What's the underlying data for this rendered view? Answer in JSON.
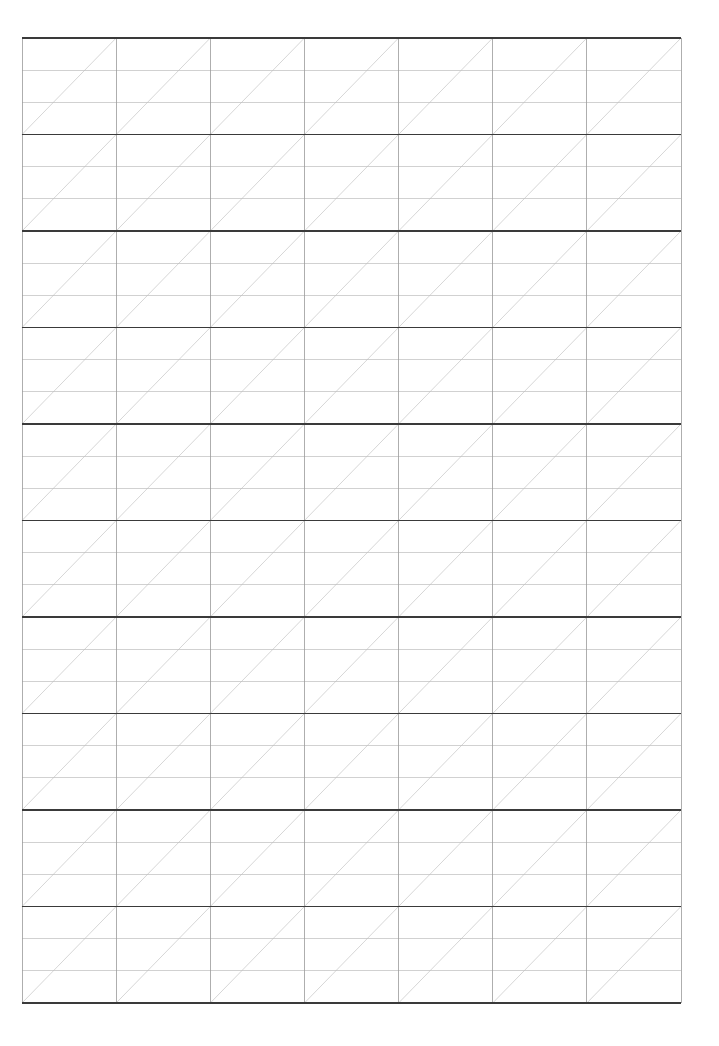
{
  "page": {
    "width": 719,
    "height": 1046,
    "background_color": "#ffffff"
  },
  "grid": {
    "name": "practice-grid",
    "origin_x": 22,
    "origin_y": 38,
    "width": 659,
    "height": 965,
    "columns": 7,
    "rows": 10,
    "cell_width": 94.14,
    "cell_height": 96.5,
    "sub_rows_per_cell": 3,
    "diagonal_direction": "bottom-left-to-top-right",
    "colors": {
      "major_horizontal_line": "#3a3a3a",
      "vertical_line": "#9a9a9a",
      "sub_horizontal_line": "#bdbdbd",
      "diagonal_line": "#c4c4c4",
      "background": "#ffffff"
    },
    "stroke_widths": {
      "major_horizontal_line": 1.6,
      "vertical_line": 0.8,
      "sub_horizontal_line": 0.7,
      "diagonal_line": 0.7
    }
  },
  "chart_data": {
    "type": "table",
    "xlabel": "",
    "ylabel": "",
    "categories": [
      "col-1",
      "col-2",
      "col-3",
      "col-4",
      "col-5",
      "col-6",
      "col-7"
    ],
    "values": [
      10,
      10,
      10,
      10,
      10,
      10,
      10
    ],
    "rows": 10,
    "columns": 7,
    "cells_total": 70,
    "grid": true,
    "legend": "none"
  }
}
